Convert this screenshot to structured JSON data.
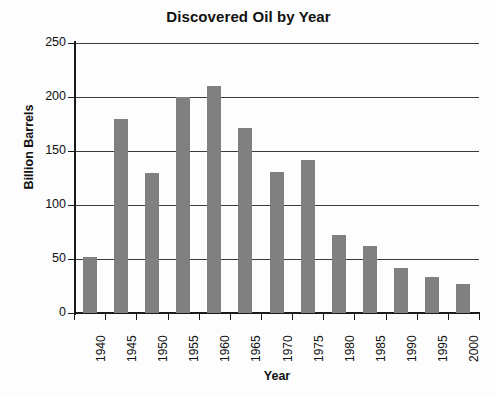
{
  "chart_data": {
    "type": "bar",
    "title": "Discovered Oil by Year",
    "xlabel": "Year",
    "ylabel": "Billion Barrels",
    "categories": [
      "1940",
      "1945",
      "1950",
      "1955",
      "1960",
      "1965",
      "1970",
      "1975",
      "1980",
      "1985",
      "1990",
      "1995",
      "2000"
    ],
    "values": [
      52,
      180,
      130,
      200,
      210,
      171,
      131,
      142,
      72,
      62,
      42,
      33,
      27
    ],
    "ylim": [
      0,
      250
    ],
    "ytick_labels": [
      "0",
      "50",
      "100",
      "150",
      "200",
      "250"
    ],
    "ytick_values": [
      0,
      50,
      100,
      150,
      200,
      250
    ],
    "grid": true,
    "legend": false,
    "bar_color": "#808080",
    "axis_color": "#1a1a1a",
    "background_color": "#fdfdfd"
  }
}
